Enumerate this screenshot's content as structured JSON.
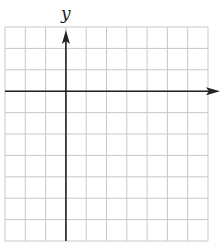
{
  "diagram": {
    "type": "coordinate-grid",
    "x_axis_label": "x",
    "y_axis_label": "y",
    "grid": {
      "columns": 10,
      "rows": 10,
      "left": 5,
      "top": 27,
      "right": 208,
      "bottom": 241,
      "y_axis_column_index": 3,
      "x_axis_row_index": 3
    },
    "colors": {
      "grid": "#c8c8c8",
      "axis": "#222222",
      "background": "#ffffff"
    }
  }
}
